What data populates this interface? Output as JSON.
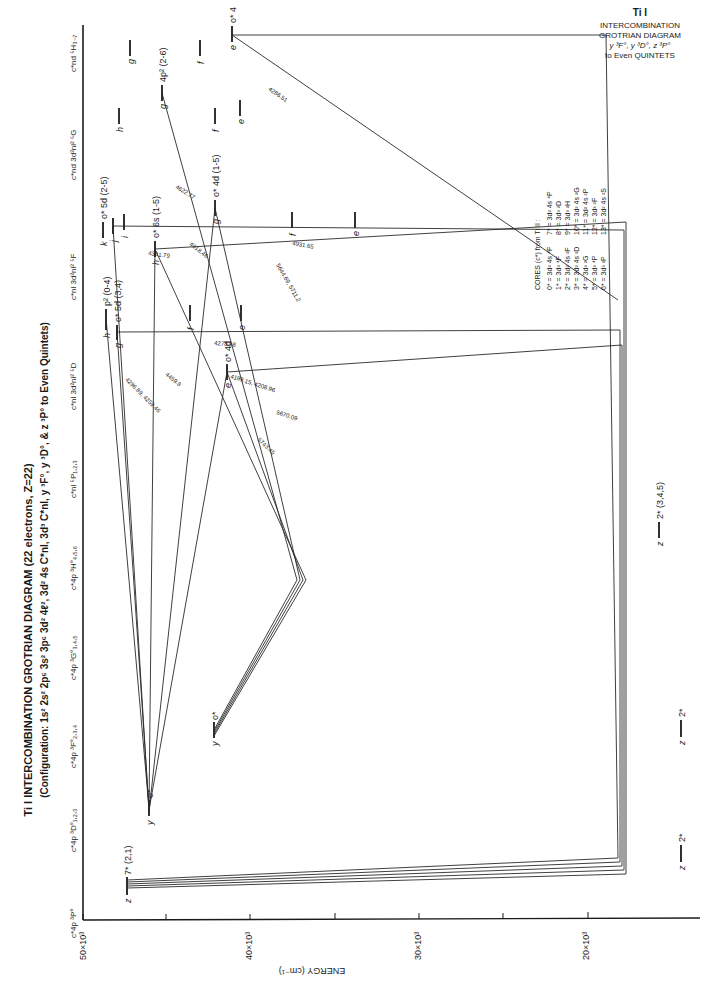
{
  "figure": {
    "title": "Ti I INTERCOMBINATION GROTRIAN DIAGRAM (22 electrons, Z=22)",
    "subtitle": "(Configuration: 1s² 2s² 2p⁶ 3s² 3p⁶ 3d² 4ℓ², 3d² 4s C*nl, 3d³ C*nl, y ³F°, y ³D°, & z ³P° to Even Quintets)",
    "orientation": "rotated 90° counter-clockwise"
  },
  "corner_title": {
    "line1": "Ti I",
    "line2": "INTERCOMBINATION",
    "line3": "GROTRIAN DIAGRAM",
    "line4": "y ³F°, y ³D°, z ³P°",
    "line5": "to Even QUINTETS"
  },
  "axis": {
    "label": "ENERGY (cm⁻¹)",
    "ticks": [
      {
        "label": "50×10³",
        "value": 50000
      },
      {
        "label": "40×10³",
        "value": 40000
      },
      {
        "label": "30×10³",
        "value": 30000
      },
      {
        "label": "20×10³",
        "value": 20000
      }
    ]
  },
  "columns": [
    {
      "id": "3P",
      "label": "c*4p ³P°"
    },
    {
      "id": "3D",
      "label": "c*4p ³D°₁,₂,₃"
    },
    {
      "id": "3F",
      "label": "c*4p ³F°₂,₃,₄"
    },
    {
      "id": "3G",
      "label": "c*4p ³G°₃,₄,₅"
    },
    {
      "id": "3H",
      "label": "c*4p ³H°₄,₅,₆"
    },
    {
      "id": "5P",
      "label": "c*nl ⁵P₁,₂,₃"
    },
    {
      "id": "5D",
      "label": "c*nl 3d²nl² ⁵D"
    },
    {
      "id": "5F",
      "label": "c*nl 3d²nl² ⁵F"
    },
    {
      "id": "5G",
      "label": "c*nd 3d²nl² ⁵G"
    },
    {
      "id": "5H",
      "label": "c*nd ⁵H₃₋₇"
    }
  ],
  "levels": [
    {
      "col": "3P",
      "letter": "z",
      "label": "7* (2,1)"
    },
    {
      "col": "3P",
      "letter": "z",
      "label": "2*"
    },
    {
      "col": "3D",
      "letter": "y",
      "label": "o*"
    },
    {
      "col": "3D",
      "letter": "z",
      "label": "2*"
    },
    {
      "col": "3F",
      "letter": "y",
      "label": "o*"
    },
    {
      "col": "3F",
      "letter": "z",
      "label": "2*"
    },
    {
      "col": "3G",
      "letter": "z",
      "label": "2* (3,4,5)"
    },
    {
      "col": "5P",
      "letter": "e",
      "label": "o* 4d"
    },
    {
      "col": "5D",
      "letter": "h",
      "label": "p² (0-4)"
    },
    {
      "col": "5D",
      "letter": "g",
      "label": "o* 5d (3,4)"
    },
    {
      "col": "5D",
      "letter": "f",
      "label": ""
    },
    {
      "col": "5D",
      "letter": "e",
      "label": ""
    },
    {
      "col": "5F",
      "letter": "k",
      "label": "o* 5d (2-5)"
    },
    {
      "col": "5F",
      "letter": "j",
      "label": ""
    },
    {
      "col": "5F",
      "letter": "i",
      "label": ""
    },
    {
      "col": "5F",
      "letter": "h",
      "label": "o* 6s (1-5)"
    },
    {
      "col": "5F",
      "letter": "g",
      "label": "o* 4d (1-5)"
    },
    {
      "col": "5F",
      "letter": "f",
      "label": ""
    },
    {
      "col": "5F",
      "letter": "e",
      "label": ""
    },
    {
      "col": "5G",
      "letter": "h",
      "label": ""
    },
    {
      "col": "5G",
      "letter": "g",
      "label": "4p² (2-6)"
    },
    {
      "col": "5G",
      "letter": "f",
      "label": ""
    },
    {
      "col": "5G",
      "letter": "e",
      "label": ""
    },
    {
      "col": "5H",
      "letter": "g",
      "label": ""
    },
    {
      "col": "5H",
      "letter": "f",
      "label": ""
    },
    {
      "col": "5H",
      "letter": "e",
      "label": "o* 4"
    }
  ],
  "wavelengths": [
    "4286.51",
    "4622.77",
    "4918.46",
    "4341.79",
    "4931.65",
    "5644.69, 5711.2",
    "4278.58",
    "4199.15, 4208.96",
    "5670.09",
    "5743.45",
    "4459.8",
    "4296.89, 4259.46"
  ],
  "cores_legend": {
    "title": "CORES (c*) from Ti II :",
    "left": [
      "0* = 3d² 4s ⁴F",
      "1* = 3d³ ⁴F",
      "2* = 3d² 4s ²F",
      "3* = 3d² 4s ²D",
      "4* = 3d³ ²G",
      "5* = 3d³ ⁴P",
      "6* = 3d³ ²P"
    ],
    "right": [
      "7* = 3d² 4s ⁴P",
      "8* = 3d³ ²D",
      "9* = 3d³ ²H",
      "10* = 3d² 4s ²G",
      "11* = 3d² 4s ²P",
      "12* = 3d³ ²F",
      "13* = 3d² 4s ²S"
    ]
  }
}
